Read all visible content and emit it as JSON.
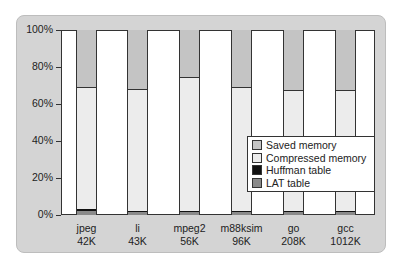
{
  "chart_data": {
    "type": "bar",
    "stacked": true,
    "normalized": true,
    "title": "",
    "xlabel": "",
    "ylabel": "",
    "ylim": [
      0,
      100
    ],
    "y_ticks": [
      "0%",
      "20%",
      "40%",
      "60%",
      "80%",
      "100%"
    ],
    "categories": [
      "jpeg\n42K",
      "li\n43K",
      "mpeg2\n56K",
      "m88ksim\n96K",
      "go\n208K",
      "gcc\n1012K"
    ],
    "category_names": [
      "jpeg",
      "li",
      "mpeg2",
      "m88ksim",
      "go",
      "gcc"
    ],
    "category_sizes": [
      "42K",
      "43K",
      "56K",
      "96K",
      "208K",
      "1012K"
    ],
    "series": [
      {
        "name": "LAT table",
        "color": "#8a8a8a",
        "values": [
          2,
          1.5,
          1.5,
          1.5,
          1.5,
          1.5
        ]
      },
      {
        "name": "Huffman table",
        "color": "#111111",
        "values": [
          1.5,
          0.5,
          0.5,
          0.5,
          0.5,
          0.5
        ]
      },
      {
        "name": "Compressed memory",
        "color": "#ececec",
        "values": [
          65,
          65.5,
          72,
          66.5,
          65,
          65
        ]
      },
      {
        "name": "Saved memory",
        "color": "#c4c4c4",
        "values": [
          31.5,
          32.5,
          26,
          31.5,
          33,
          33
        ]
      }
    ],
    "legend": [
      "Saved memory",
      "Compressed memory",
      "Huffman table",
      "LAT table"
    ],
    "legend_position": "inside lower right",
    "grid": false
  },
  "axis": {
    "y_labels": [
      "100%",
      "80%",
      "60%",
      "40%",
      "20%",
      "0%"
    ]
  },
  "xlabels": [
    {
      "name": "jpeg",
      "size": "42K"
    },
    {
      "name": "li",
      "size": "43K"
    },
    {
      "name": "mpeg2",
      "size": "56K"
    },
    {
      "name": "m88ksim",
      "size": "96K"
    },
    {
      "name": "go",
      "size": "208K"
    },
    {
      "name": "gcc",
      "size": "1012K"
    }
  ],
  "legend": [
    {
      "label": "Saved memory",
      "color": "#c4c4c4"
    },
    {
      "label": "Compressed memory",
      "color": "#ececec"
    },
    {
      "label": "Huffman table",
      "color": "#111111"
    },
    {
      "label": "LAT table",
      "color": "#8a8a8a"
    }
  ]
}
